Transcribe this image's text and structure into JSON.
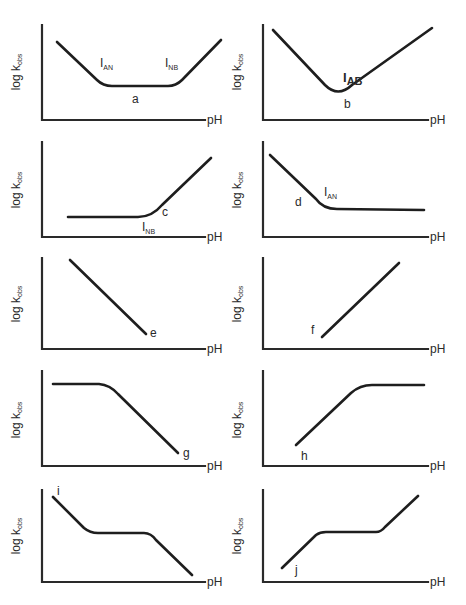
{
  "figure": {
    "x_axis_label": "pH",
    "y_axis_label_main": "log k",
    "y_axis_label_sub": "obs",
    "panels": [
      {
        "id": "a",
        "origin": [
          42,
          120
        ],
        "y_top": 25,
        "x_end": 205,
        "ph": [
          207,
          124
        ],
        "ylab": [
          20,
          72
        ],
        "curve": "M57,42 L97,80 Q103,86 112,86 L168,86 Q176,86 182,80 L221,40",
        "labels": [
          {
            "text": "I",
            "sub": "AN",
            "x": 100,
            "y": 67
          },
          {
            "text": "I",
            "sub": "NB",
            "x": 165,
            "y": 67
          },
          {
            "text": "a",
            "x": 132,
            "y": 103
          }
        ]
      },
      {
        "id": "b",
        "origin": [
          263,
          120
        ],
        "y_top": 25,
        "x_end": 428,
        "ph": [
          430,
          124
        ],
        "ylab": [
          241,
          72
        ],
        "curve": "M273,30 L325,85 Q338,98 352,85 L432,28",
        "labels": [
          {
            "text": "I",
            "sub": "AB",
            "x": 343,
            "y": 82,
            "bold": true
          },
          {
            "text": "b",
            "x": 344,
            "y": 108
          }
        ]
      },
      {
        "id": "c",
        "origin": [
          42,
          237
        ],
        "y_top": 142,
        "x_end": 205,
        "ph": [
          207,
          241
        ],
        "ylab": [
          20,
          190
        ],
        "curve": "M68,217 L138,217 Q152,217 162,205 L211,158",
        "labels": [
          {
            "text": "c",
            "x": 162,
            "y": 216
          },
          {
            "text": "I",
            "sub": "NB",
            "x": 142,
            "y": 231
          }
        ]
      },
      {
        "id": "d",
        "origin": [
          263,
          237
        ],
        "y_top": 142,
        "x_end": 428,
        "ph": [
          430,
          241
        ],
        "ylab": [
          241,
          190
        ],
        "curve": "M270,155 L316,199 Q323,209 337,209 L424,210",
        "labels": [
          {
            "text": "d",
            "x": 295,
            "y": 206
          },
          {
            "text": "I",
            "sub": "AN",
            "x": 324,
            "y": 196
          }
        ]
      },
      {
        "id": "e",
        "origin": [
          42,
          349
        ],
        "y_top": 258,
        "x_end": 205,
        "ph": [
          207,
          353
        ],
        "ylab": [
          20,
          304
        ],
        "curve": "M70,260 L146,334",
        "labels": [
          {
            "text": "e",
            "x": 150,
            "y": 337
          }
        ]
      },
      {
        "id": "f",
        "origin": [
          263,
          349
        ],
        "y_top": 258,
        "x_end": 428,
        "ph": [
          430,
          353
        ],
        "ylab": [
          241,
          304
        ],
        "curve": "M322,337 L399,263",
        "labels": [
          {
            "text": "f",
            "x": 311,
            "y": 334
          }
        ]
      },
      {
        "id": "g",
        "origin": [
          42,
          466
        ],
        "y_top": 371,
        "x_end": 205,
        "ph": [
          207,
          470
        ],
        "ylab": [
          20,
          420
        ],
        "curve": "M53,384 L99,384 Q110,385 118,394 L178,453",
        "labels": [
          {
            "text": "g",
            "x": 183,
            "y": 457
          }
        ]
      },
      {
        "id": "h",
        "origin": [
          263,
          466
        ],
        "y_top": 371,
        "x_end": 428,
        "ph": [
          430,
          470
        ],
        "ylab": [
          241,
          420
        ],
        "curve": "M296,445 L351,393 Q360,385 372,385 L424,385",
        "labels": [
          {
            "text": "h",
            "x": 301,
            "y": 460
          }
        ]
      },
      {
        "id": "i",
        "origin": [
          42,
          582
        ],
        "y_top": 490,
        "x_end": 205,
        "ph": [
          207,
          586
        ],
        "ylab": [
          20,
          536
        ],
        "curve": "M53,497 L84,528 Q90,533 98,533 L144,533 Q151,533 156,540 L192,575",
        "labels": [
          {
            "text": "i",
            "x": 57,
            "y": 495
          }
        ]
      },
      {
        "id": "j",
        "origin": [
          263,
          582
        ],
        "y_top": 490,
        "x_end": 428,
        "ph": [
          430,
          586
        ],
        "ylab": [
          241,
          536
        ],
        "curve": "M282,568 L316,535 Q320,532 326,532 L376,532 Q381,532 385,527 L418,496",
        "labels": [
          {
            "text": "j",
            "x": 295,
            "y": 574
          }
        ]
      }
    ]
  }
}
